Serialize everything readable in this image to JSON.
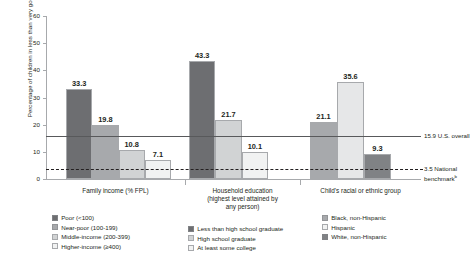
{
  "chart_data": {
    "type": "bar",
    "title": "",
    "xlabel": "",
    "ylabel": "Percentage of children in less than very good health",
    "ylabel_superscript": "a",
    "ylim": [
      0,
      60
    ],
    "yticks": [
      "0",
      "10",
      "20",
      "30",
      "40",
      "50",
      "60"
    ],
    "grid": false,
    "legend_position": "bottom",
    "groups": [
      {
        "name": "Family income (% FPL)",
        "label_lines": [
          "Family income (% FPL)"
        ],
        "categories": [
          "Poor (<100)",
          "Near-poor (100-199)",
          "Middle-income (200-399)",
          "Higher-income (≥400)"
        ],
        "values": [
          33.3,
          19.8,
          10.8,
          7.1
        ],
        "value_labels": [
          "33.3",
          "19.8",
          "10.8",
          "7.1"
        ],
        "shades": [
          "#6d6e71",
          "#a7a9ac",
          "#d1d3d4",
          "#f1f2f2"
        ]
      },
      {
        "name": "Household education (highest level attained by any person)",
        "label_lines": [
          "Household education",
          "(highest level attained by",
          "any person)"
        ],
        "categories": [
          "Less than high school graduate",
          "High school graduate",
          "At least some college"
        ],
        "values": [
          43.3,
          21.7,
          10.1
        ],
        "value_labels": [
          "43.3",
          "21.7",
          "10.1"
        ],
        "shades": [
          "#6d6e71",
          "#d1d3d4",
          "#f1f2f2"
        ]
      },
      {
        "name": "Child's racial or ethnic group",
        "label_lines": [
          "Child's racial or ethnic group"
        ],
        "categories": [
          "Black, non-Hispanic",
          "Hispanic",
          "White, non-Hispanic"
        ],
        "values": [
          21.1,
          35.6,
          9.3
        ],
        "value_labels": [
          "21.1",
          "35.6",
          "9.3"
        ],
        "shades": [
          "#a7a9ac",
          "#e6e7e8",
          "#808285"
        ]
      }
    ],
    "reference_lines": [
      {
        "value": 15.9,
        "style": "solid",
        "label_value": "15.9",
        "label_text": "U.S. overall",
        "superscript": ""
      },
      {
        "value": 3.5,
        "style": "dashed",
        "label_value": "3.5",
        "label_text_line1": "National",
        "label_text_line2": "benchmark",
        "superscript": "b"
      }
    ]
  },
  "legends": [
    {
      "id": "family-income",
      "items": [
        {
          "label": "Poor (<100)",
          "color": "#6d6e71",
          "border": "#808285"
        },
        {
          "label": "Near-poor (100-199)",
          "color": "#a7a9ac",
          "border": "#939598"
        },
        {
          "label": "Middle-income (200-399)",
          "color": "#d1d3d4",
          "border": "#a7a9ac"
        },
        {
          "label": "Higher-income (≥400)",
          "color": "#f1f2f2",
          "border": "#a7a9ac"
        }
      ]
    },
    {
      "id": "household-education",
      "items": [
        {
          "label": "Less than high school graduate",
          "color": "#6d6e71",
          "border": "#808285"
        },
        {
          "label": "High school graduate",
          "color": "#d1d3d4",
          "border": "#a7a9ac"
        },
        {
          "label": "At least some college",
          "color": "#f1f2f2",
          "border": "#a7a9ac"
        }
      ]
    },
    {
      "id": "race-ethnicity",
      "items": [
        {
          "label": "Black, non-Hispanic",
          "color": "#a7a9ac",
          "border": "#939598"
        },
        {
          "label": "Hispanic",
          "color": "#f1f2f2",
          "border": "#a7a9ac"
        },
        {
          "label": "White, non-Hispanic",
          "color": "#808285",
          "border": "#808285"
        }
      ]
    }
  ]
}
